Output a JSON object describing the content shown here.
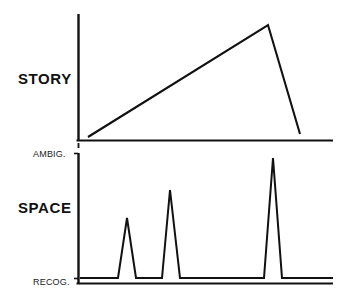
{
  "figure": {
    "title": "",
    "background_color": "#ffffff",
    "line_color": "#111111",
    "panels": [
      {
        "id": "story",
        "label": "STORY",
        "y_tick_labels": [],
        "axis": {
          "x0": 78,
          "y_top": 14,
          "y_base": 140,
          "x_right": 333
        }
      },
      {
        "id": "space",
        "label": "SPACE",
        "y_tick_labels": [
          "AMBIG.",
          "RECOG."
        ],
        "axis": {
          "x0": 78,
          "y_top": 153,
          "y_base": 283,
          "x_right": 333
        }
      }
    ]
  },
  "chart_data": [
    {
      "type": "line",
      "id": "story",
      "title": "STORY",
      "ylabel": "STORY",
      "xlabel": "",
      "grid": false,
      "legend": "none",
      "xlim": [
        78,
        333
      ],
      "ylim": [
        140,
        14
      ],
      "series": [
        {
          "name": "story-arc",
          "points": [
            {
              "x": 88,
              "y": 137
            },
            {
              "x": 268,
              "y": 25
            },
            {
              "x": 300,
              "y": 134
            }
          ]
        }
      ],
      "annotations": [
        "rising action to climax then sharp fall"
      ]
    },
    {
      "type": "line",
      "id": "space",
      "title": "SPACE",
      "ylabel": "SPACE",
      "xlabel": "",
      "grid": false,
      "legend": "none",
      "xlim": [
        78,
        333
      ],
      "ylim": [
        283,
        153
      ],
      "y_axis_ticks": [
        {
          "label": "AMBIG.",
          "y": 153
        },
        {
          "label": "RECOG.",
          "y": 283
        }
      ],
      "series": [
        {
          "name": "space-spikes",
          "points": [
            {
              "x": 80,
              "y": 278
            },
            {
              "x": 118,
              "y": 278
            },
            {
              "x": 127,
              "y": 218
            },
            {
              "x": 136,
              "y": 278
            },
            {
              "x": 162,
              "y": 278
            },
            {
              "x": 170,
              "y": 190
            },
            {
              "x": 180,
              "y": 278
            },
            {
              "x": 264,
              "y": 278
            },
            {
              "x": 273,
              "y": 158
            },
            {
              "x": 282,
              "y": 278
            },
            {
              "x": 333,
              "y": 278
            }
          ]
        }
      ],
      "peaks": [
        {
          "index": 1,
          "x": 127,
          "height_fraction": 0.46
        },
        {
          "index": 2,
          "x": 170,
          "height_fraction": 0.68
        },
        {
          "index": 3,
          "x": 273,
          "height_fraction": 0.92
        }
      ],
      "annotations": [
        "three ambiguity spikes of increasing magnitude"
      ]
    }
  ]
}
